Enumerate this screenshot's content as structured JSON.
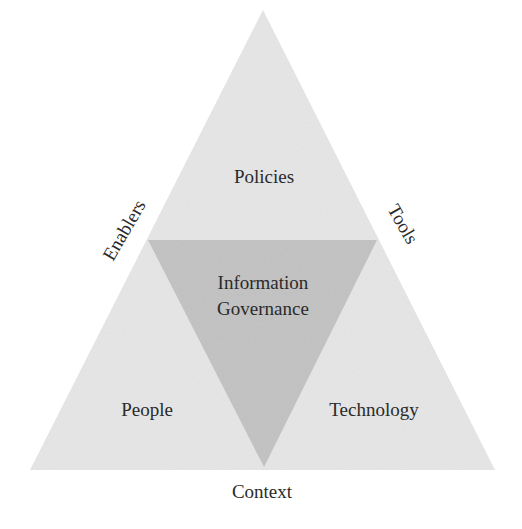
{
  "diagram": {
    "type": "nested-triangle",
    "colors": {
      "outer_fill": "#e6e6e6",
      "inner_fill": "#c2c2c2",
      "text": "#2a2a2a",
      "background": "#ffffff"
    },
    "center": {
      "line1": "Information",
      "line2": "Governance"
    },
    "corners": {
      "top": "Policies",
      "bottom_left": "People",
      "bottom_right": "Technology"
    },
    "sides": {
      "left": "Enablers",
      "right": "Tools",
      "bottom": "Context"
    }
  }
}
